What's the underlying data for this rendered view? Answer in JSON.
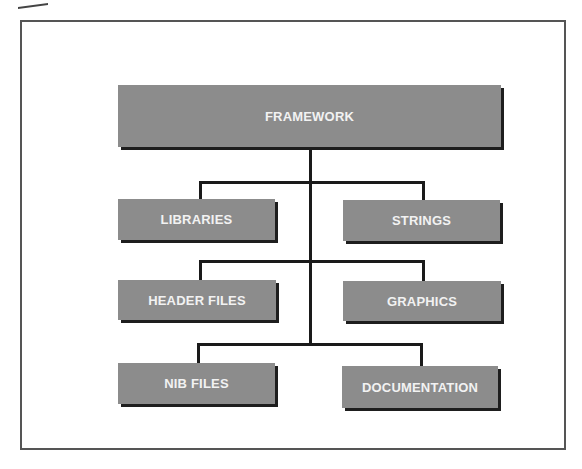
{
  "diagram": {
    "type": "hierarchy",
    "root": {
      "label": "FRAMEWORK"
    },
    "children": [
      {
        "label": "LIBRARIES",
        "side": "left",
        "row": 1
      },
      {
        "label": "STRINGS",
        "side": "right",
        "row": 1
      },
      {
        "label": "HEADER FILES",
        "side": "left",
        "row": 2
      },
      {
        "label": "GRAPHICS",
        "side": "right",
        "row": 2
      },
      {
        "label": "NIB FILES",
        "side": "left",
        "row": 3
      },
      {
        "label": "DOCUMENTATION",
        "side": "right",
        "row": 3
      }
    ],
    "colors": {
      "node_fill": "#8c8c8c",
      "node_text": "#f2f2f2",
      "shadow": "#1e1e1e",
      "connector": "#1a1a1a",
      "frame": "#555555"
    }
  }
}
